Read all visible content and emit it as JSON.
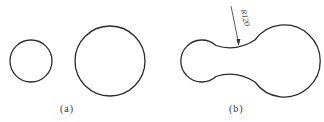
{
  "figure": {
    "panels": [
      {
        "id": "a",
        "label": "(a)",
        "description": "Two separate circles",
        "circles": [
          {
            "name": "small-circle",
            "cx": 31,
            "cy": 61,
            "r": 21
          },
          {
            "name": "large-circle",
            "cx": 110,
            "cy": 61,
            "r": 35
          }
        ]
      },
      {
        "id": "b",
        "label": "(b)",
        "description": "Two circles joined by tangent arcs of radius R120",
        "circles": [
          {
            "name": "small-circle",
            "cx": 202,
            "cy": 61,
            "r": 21
          },
          {
            "name": "large-circle",
            "cx": 285,
            "cy": 61,
            "r": 36
          }
        ],
        "dimension": {
          "text": "R120"
        }
      }
    ],
    "stroke_color": "#2a2a2a"
  }
}
